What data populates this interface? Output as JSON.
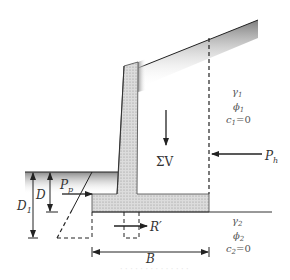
{
  "figure": {
    "colors": {
      "line": "#222222",
      "concrete_fill": "#d9d9d9",
      "concrete_dots": "#9a9a9a",
      "soil_shade_dark": "#8a8a8a",
      "soil_shade_light": "#ffffff"
    },
    "labels": {
      "sum_v": "ΣV",
      "p_h": "P",
      "p_h_sub": "h",
      "p_p": "P",
      "p_p_sub": "p",
      "r_prime": "R′",
      "d": "D",
      "d1": "D",
      "d1_sub": "1",
      "b": "B"
    },
    "backfill_soil": {
      "gamma": "γ",
      "gamma_sub": "1",
      "phi": "ϕ",
      "phi_sub": "1",
      "c": "c",
      "c_sub": "1",
      "c_value": "=0"
    },
    "foundation_soil": {
      "gamma": "γ",
      "gamma_sub": "2",
      "phi": "ϕ",
      "phi_sub": "2",
      "c": "c",
      "c_sub": "2",
      "c_value": "=0"
    },
    "caption": "· · · ·  · · ·  · · ·  · · · ·"
  }
}
